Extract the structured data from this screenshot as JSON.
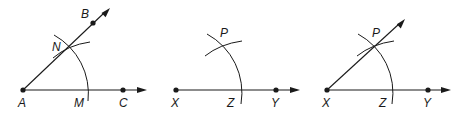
{
  "diagram": {
    "panels": [
      {
        "id": "panel-1",
        "description": "Given angle BAC with arc centered at A crossing AB at N and AC at M",
        "points": [
          {
            "label": "A",
            "role": "vertex"
          },
          {
            "label": "B",
            "role": "point on ray AB"
          },
          {
            "label": "N",
            "role": "arc intersection on AB"
          },
          {
            "label": "M",
            "role": "arc intersection on AC"
          },
          {
            "label": "C",
            "role": "point on ray AC"
          }
        ]
      },
      {
        "id": "panel-2",
        "description": "Ray XY with arc centered at X crossing at Z, and arc centered at Z crossing at P",
        "points": [
          {
            "label": "P",
            "role": "arc intersection"
          },
          {
            "label": "X",
            "role": "vertex"
          },
          {
            "label": "Z",
            "role": "arc intersection on XY"
          },
          {
            "label": "Y",
            "role": "point on ray XY"
          }
        ]
      },
      {
        "id": "panel-3",
        "description": "Ray XP drawn, completing copied angle PXY",
        "points": [
          {
            "label": "P",
            "role": "point on ray XP"
          },
          {
            "label": "X",
            "role": "vertex"
          },
          {
            "label": "Z",
            "role": "arc intersection on XY"
          },
          {
            "label": "Y",
            "role": "point on ray XY"
          }
        ]
      }
    ],
    "colors": {
      "stroke": "#1a1a1a",
      "background": "#ffffff"
    }
  }
}
